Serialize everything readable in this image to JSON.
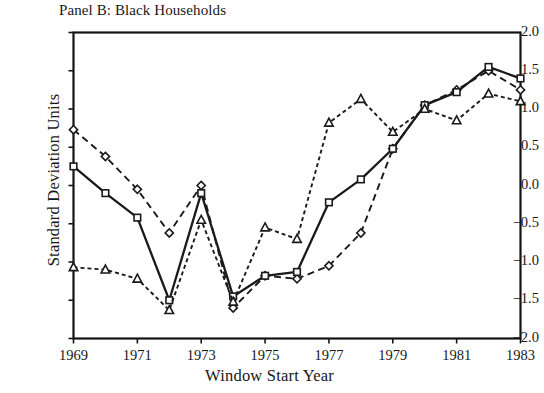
{
  "chart_data": {
    "type": "line",
    "title": "Panel B: Black Households",
    "xlabel": "Window Start Year",
    "ylabel": "Standard Deviation Units",
    "x": [
      1969,
      1970,
      1971,
      1972,
      1973,
      1974,
      1975,
      1976,
      1977,
      1978,
      1979,
      1980,
      1981,
      1982,
      1983
    ],
    "xlim": [
      1969,
      1983
    ],
    "ylim": [
      -2.0,
      2.0
    ],
    "xticks": [
      1969,
      1971,
      1973,
      1975,
      1977,
      1979,
      1981,
      1983
    ],
    "xtick_labels": [
      "1969",
      "1971",
      "1973",
      "1975",
      "1977",
      "1979",
      "1981",
      "1983"
    ],
    "yticks": [
      2.0,
      1.5,
      1.0,
      0.5,
      0.0,
      -0.5,
      -1.0,
      -1.5,
      -2.0
    ],
    "ytick_labels": [
      "2.0",
      "1.5",
      "1.0",
      "0.5",
      "0.0",
      "-0.5",
      "-1.0",
      "-1.5",
      "-2.0"
    ],
    "grid": false,
    "legend": "none",
    "series": [
      {
        "name": "diamond-series",
        "marker": "diamond",
        "linestyle": "dashed",
        "color": "#1a1a1a",
        "values": [
          0.73,
          0.38,
          -0.05,
          -0.62,
          0.0,
          -1.6,
          -1.18,
          -1.22,
          -1.05,
          -0.62,
          0.48,
          1.05,
          1.25,
          1.5,
          1.25
        ]
      },
      {
        "name": "square-series",
        "marker": "square",
        "linestyle": "solid",
        "color": "#1a1a1a",
        "values": [
          0.25,
          -0.1,
          -0.42,
          -1.5,
          -0.1,
          -1.45,
          -1.18,
          -1.13,
          -0.22,
          0.08,
          0.48,
          1.05,
          1.22,
          1.55,
          1.4
        ]
      },
      {
        "name": "triangle-series",
        "marker": "triangle",
        "linestyle": "dotted",
        "color": "#1a1a1a",
        "values": [
          -1.07,
          -1.1,
          -1.22,
          -1.63,
          -0.45,
          -1.52,
          -0.55,
          -0.7,
          0.82,
          1.13,
          0.7,
          1.0,
          0.85,
          1.2,
          1.1
        ]
      }
    ]
  }
}
